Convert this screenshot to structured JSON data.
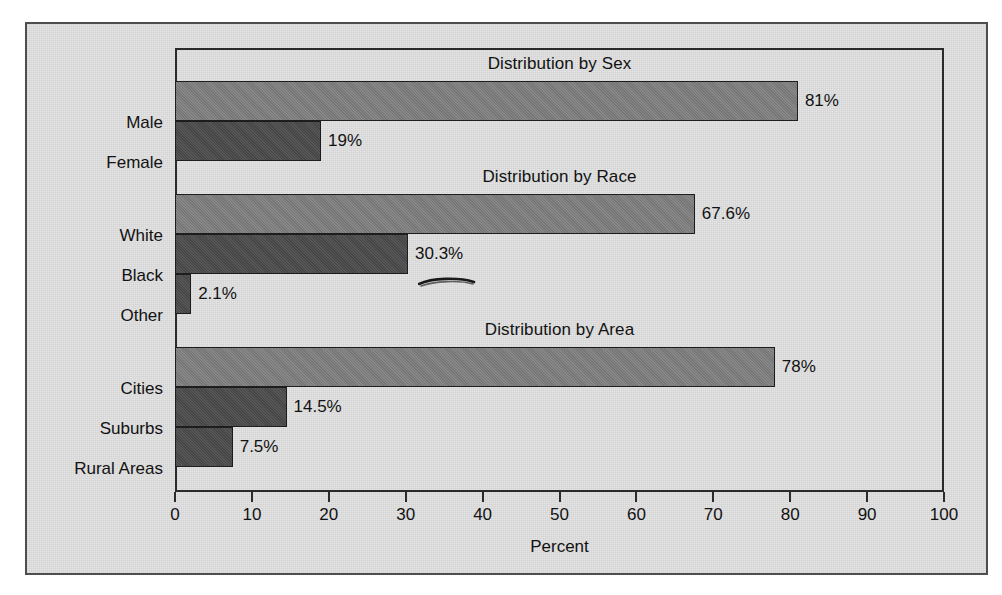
{
  "chart_data": {
    "type": "bar",
    "orientation": "horizontal",
    "title": "",
    "xlabel": "Percent",
    "ylabel": "",
    "xlim": [
      0,
      100
    ],
    "xticks": [
      0,
      10,
      20,
      30,
      40,
      50,
      60,
      70,
      80,
      90,
      100
    ],
    "xtick_labels": [
      "0",
      "10",
      "20",
      "30",
      "40",
      "50",
      "60",
      "70",
      "80",
      "90",
      "100"
    ],
    "grid": false,
    "legend": "none",
    "groups": [
      {
        "title": "Distribution by Sex",
        "categories": [
          "Male",
          "Female"
        ],
        "values": [
          81,
          19
        ],
        "value_labels": [
          "81%",
          "19%"
        ],
        "shades": [
          "light",
          "dark"
        ]
      },
      {
        "title": "Distribution by Race",
        "categories": [
          "White",
          "Black",
          "Other"
        ],
        "values": [
          67.6,
          30.3,
          2.1
        ],
        "value_labels": [
          "67.6%",
          "30.3%",
          "2.1%"
        ],
        "shades": [
          "light",
          "dark",
          "dark"
        ]
      },
      {
        "title": "Distribution by Area",
        "categories": [
          "Cities",
          "Suburbs",
          "Rural Areas"
        ],
        "values": [
          78,
          14.5,
          7.5
        ],
        "value_labels": [
          "78%",
          "14.5%",
          "7.5%"
        ],
        "shades": [
          "light",
          "dark",
          "dark"
        ]
      }
    ],
    "annotations": [
      {
        "name": "handwritten-underline",
        "target": "30.3%"
      }
    ]
  },
  "colors": {
    "page_background": "#ffffff",
    "figure_background": "#e2e2e2",
    "frame_border": "#4e4e4e",
    "plot_border": "#2b2b2b",
    "bar_light": "#7c7c7c",
    "bar_dark": "#4a4a4a",
    "bar_outline": "#1d1d1d",
    "text": "#121212"
  }
}
